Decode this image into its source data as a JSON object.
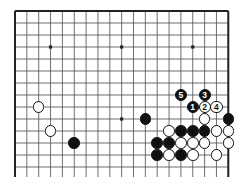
{
  "diagram": {
    "type": "go-board-problem-diagram",
    "title": "",
    "board": {
      "columns": 18,
      "rows": 14,
      "left_px": 15,
      "top_px": 11,
      "cell_w_px": 11.85,
      "cell_h_px": 12.0,
      "line_color": "#555555",
      "border_color": "#222222",
      "background_color": "#ffffff",
      "star_points": [
        {
          "col": 3,
          "row": 3
        },
        {
          "col": 9,
          "row": 3
        },
        {
          "col": 15,
          "row": 3
        },
        {
          "col": 9,
          "row": 9
        }
      ]
    },
    "stones": [
      {
        "col": 2,
        "row": 8,
        "color": "white",
        "label": ""
      },
      {
        "col": 3,
        "row": 10,
        "color": "white",
        "label": ""
      },
      {
        "col": 5,
        "row": 11,
        "color": "black",
        "label": ""
      },
      {
        "col": 11,
        "row": 9,
        "color": "black",
        "label": ""
      },
      {
        "col": 16,
        "row": 9,
        "color": "white",
        "label": ""
      },
      {
        "col": 18,
        "row": 9,
        "color": "black",
        "label": ""
      },
      {
        "col": 13,
        "row": 10,
        "color": "white",
        "label": ""
      },
      {
        "col": 14,
        "row": 10,
        "color": "black",
        "label": ""
      },
      {
        "col": 15,
        "row": 10,
        "color": "black",
        "label": ""
      },
      {
        "col": 16,
        "row": 10,
        "color": "black",
        "label": ""
      },
      {
        "col": 17,
        "row": 10,
        "color": "white",
        "label": ""
      },
      {
        "col": 18,
        "row": 10,
        "color": "white",
        "label": ""
      },
      {
        "col": 12,
        "row": 11,
        "color": "black",
        "label": ""
      },
      {
        "col": 13,
        "row": 11,
        "color": "black",
        "label": ""
      },
      {
        "col": 14,
        "row": 11,
        "color": "white",
        "label": ""
      },
      {
        "col": 15,
        "row": 11,
        "color": "white",
        "label": ""
      },
      {
        "col": 16,
        "row": 11,
        "color": "white",
        "label": ""
      },
      {
        "col": 18,
        "row": 11,
        "color": "white",
        "label": ""
      },
      {
        "col": 12,
        "row": 12,
        "color": "black",
        "label": ""
      },
      {
        "col": 13,
        "row": 12,
        "color": "white",
        "label": ""
      },
      {
        "col": 14,
        "row": 12,
        "color": "black",
        "label": ""
      },
      {
        "col": 15,
        "row": 12,
        "color": "white",
        "label": ""
      },
      {
        "col": 17,
        "row": 12,
        "color": "white",
        "label": ""
      }
    ],
    "move_markers": [
      {
        "col": 15,
        "row": 8,
        "color": "black",
        "label": "1"
      },
      {
        "col": 16,
        "row": 8,
        "color": "white",
        "label": "2"
      },
      {
        "col": 16,
        "row": 7,
        "color": "black",
        "label": "3"
      },
      {
        "col": 17,
        "row": 8,
        "color": "white",
        "label": "4"
      },
      {
        "col": 14,
        "row": 7,
        "color": "black",
        "label": "5"
      }
    ],
    "legend": {
      "black_label": "Black",
      "white_label": "White",
      "move_sequence": [
        "1",
        "2",
        "3",
        "4",
        "5"
      ]
    },
    "colors": {
      "black_stone": "#111111",
      "white_stone": "#ffffff",
      "grid": "#555555",
      "border": "#222222"
    }
  }
}
